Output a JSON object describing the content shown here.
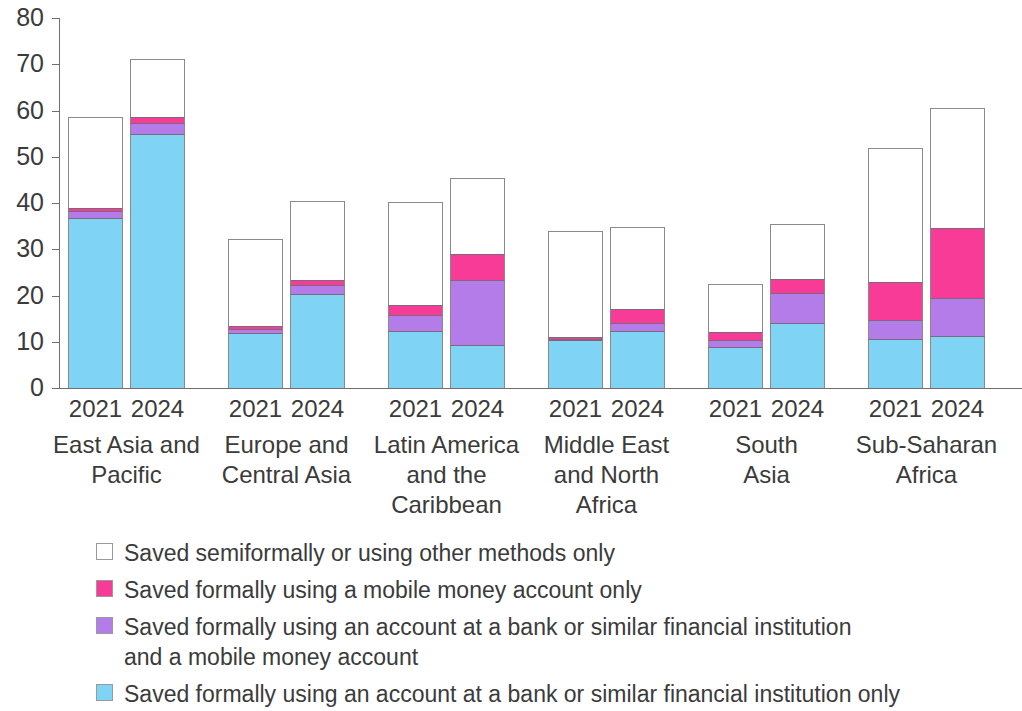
{
  "chart_data": {
    "type": "bar",
    "subtype": "stacked-bar-grouped",
    "title": "",
    "xlabel": "",
    "ylabel": "",
    "ylim": [
      0,
      80
    ],
    "y_ticks": [
      "0",
      "10",
      "20",
      "30",
      "40",
      "50",
      "60",
      "70",
      "80"
    ],
    "grid": false,
    "legend_position": "bottom",
    "stack_order_bottom_to_top": [
      "Saved formally using an account at a bank or similar financial institution only",
      "Saved formally using an account at a bank or similar financial institution and a mobile money account",
      "Saved formally using a mobile money account only",
      "Saved semiformally or using other methods only"
    ],
    "series": [
      {
        "name": "Saved formally using an account at a bank or similar financial institution only",
        "color": "#7FD4F5",
        "values": [
          36.8,
          55.0,
          11.9,
          20.3,
          12.3,
          9.4,
          10.3,
          12.3,
          8.8,
          14.0,
          10.7,
          11.3
        ]
      },
      {
        "name": "Saved formally using an account at a bank or similar financial institution and a mobile money account",
        "color": "#B37CE8",
        "values": [
          1.5,
          2.4,
          0.9,
          1.9,
          3.5,
          14.0,
          0.4,
          1.7,
          1.5,
          6.5,
          3.9,
          8.2
        ]
      },
      {
        "name": "Saved formally using a mobile money account only",
        "color": "#F73B96",
        "values": [
          0.6,
          1.2,
          0.5,
          1.2,
          2.1,
          5.5,
          0.2,
          3.0,
          1.9,
          3.0,
          8.3,
          15.0
        ]
      },
      {
        "name": "Saved semiformally or using other methods only",
        "color": "#FFFFFF",
        "values": [
          19.6,
          12.5,
          19.0,
          17.1,
          22.4,
          16.6,
          23.0,
          17.9,
          10.3,
          12.0,
          29.0,
          26.0
        ]
      }
    ],
    "bars": [
      {
        "group": "East Asia and Pacific",
        "year": "2021",
        "total": 58.5,
        "blue": 36.8,
        "purple": 1.5,
        "pink": 0.6,
        "white": 19.6
      },
      {
        "group": "East Asia and Pacific",
        "year": "2024",
        "total": 71.1,
        "blue": 55.0,
        "purple": 2.4,
        "pink": 1.2,
        "white": 12.5
      },
      {
        "group": "Europe and Central Asia",
        "year": "2021",
        "total": 32.3,
        "blue": 11.9,
        "purple": 0.9,
        "pink": 0.5,
        "white": 19.0
      },
      {
        "group": "Europe and Central Asia",
        "year": "2024",
        "total": 40.5,
        "blue": 20.3,
        "purple": 1.9,
        "pink": 1.2,
        "white": 17.1
      },
      {
        "group": "Latin America and the Caribbean",
        "year": "2021",
        "total": 40.3,
        "blue": 12.3,
        "purple": 3.5,
        "pink": 2.1,
        "white": 22.4
      },
      {
        "group": "Latin America and the Caribbean",
        "year": "2024",
        "total": 45.5,
        "blue": 9.4,
        "purple": 14.0,
        "pink": 5.5,
        "white": 16.6
      },
      {
        "group": "Middle East and North Africa",
        "year": "2021",
        "total": 33.9,
        "blue": 10.3,
        "purple": 0.4,
        "pink": 0.2,
        "white": 23.0
      },
      {
        "group": "Middle East and North Africa",
        "year": "2024",
        "total": 34.9,
        "blue": 12.3,
        "purple": 1.7,
        "pink": 3.0,
        "white": 17.9
      },
      {
        "group": "South Asia",
        "year": "2021",
        "total": 22.5,
        "blue": 8.8,
        "purple": 1.5,
        "pink": 1.9,
        "white": 10.3
      },
      {
        "group": "South Asia",
        "year": "2024",
        "total": 35.5,
        "blue": 14.0,
        "purple": 6.5,
        "pink": 3.0,
        "white": 12.0
      },
      {
        "group": "Sub-Saharan Africa",
        "year": "2021",
        "total": 51.9,
        "blue": 10.7,
        "purple": 3.9,
        "pink": 8.3,
        "white": 29.0
      },
      {
        "group": "Sub-Saharan Africa",
        "year": "2024",
        "total": 60.5,
        "blue": 11.3,
        "purple": 8.2,
        "pink": 15.0,
        "white": 26.0
      }
    ],
    "groups": [
      {
        "label_lines": [
          "East Asia and",
          "Pacific"
        ],
        "years": [
          "2021",
          "2024"
        ]
      },
      {
        "label_lines": [
          "Europe and",
          "Central Asia"
        ],
        "years": [
          "2021",
          "2024"
        ]
      },
      {
        "label_lines": [
          "Latin America",
          "and the",
          "Caribbean"
        ],
        "years": [
          "2021",
          "2024"
        ]
      },
      {
        "label_lines": [
          "Middle East",
          "and North",
          "Africa"
        ],
        "years": [
          "2021",
          "2024"
        ]
      },
      {
        "label_lines": [
          "South",
          "Asia"
        ],
        "years": [
          "2021",
          "2024"
        ]
      },
      {
        "label_lines": [
          "Sub-Saharan",
          "Africa"
        ],
        "years": [
          "2021",
          "2024"
        ]
      }
    ],
    "legend": [
      {
        "color": "#FFFFFF",
        "line1": "Saved semiformally or using other methods only",
        "line2": ""
      },
      {
        "color": "#F73B96",
        "line1": "Saved formally using a mobile money account only",
        "line2": ""
      },
      {
        "color": "#B37CE8",
        "line1": "Saved formally using an account at a bank or similar financial institution",
        "line2": "and a mobile money account"
      },
      {
        "color": "#7FD4F5",
        "line1": "Saved formally using an account at a bank or similar financial institution only",
        "line2": ""
      }
    ]
  }
}
